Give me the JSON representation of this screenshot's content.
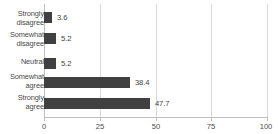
{
  "chart_data": {
    "type": "bar",
    "orientation": "horizontal",
    "title": "",
    "subtitle": "",
    "xlabel": "",
    "ylabel": "",
    "xlim": [
      0,
      100
    ],
    "xticks": [
      "0",
      "25",
      "50",
      "75",
      "100"
    ],
    "grid": "vertical",
    "legend": "none",
    "categories": [
      "Strongly disagree",
      "Somewhat disagree",
      "Neutral",
      "Somewhat agree",
      "Strongly agree"
    ],
    "values": [
      3.6,
      5.2,
      5.2,
      38.4,
      47.7
    ],
    "value_labels": [
      "3.6",
      "5.2",
      "5.2",
      "38.4",
      "47.7"
    ],
    "bar_color": "#404040",
    "grid_color": "#d9d9d9",
    "axis_color": "#bfbfbf",
    "text_color": "#4a4a4a"
  },
  "categories_wrapped": [
    {
      "line1": "Strongly",
      "line2": "disagree"
    },
    {
      "line1": "Somewhat",
      "line2": "disagree"
    },
    {
      "line1": "Neutral",
      "line2": ""
    },
    {
      "line1": "Somewhat",
      "line2": "agree"
    },
    {
      "line1": "Strongly",
      "line2": "agree"
    }
  ]
}
